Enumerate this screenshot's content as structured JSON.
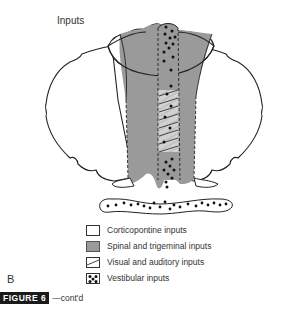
{
  "diagram": {
    "title": "Inputs",
    "panel_letter": "B",
    "colors": {
      "spinal_trigeminal_fill": "#9a9a9a",
      "outline": "#222222",
      "dot": "#111111"
    }
  },
  "legend": {
    "items": [
      {
        "label": "Corticopontine inputs",
        "pattern": "white"
      },
      {
        "label": "Spinal and trigeminal inputs",
        "pattern": "gray"
      },
      {
        "label": "Visual and auditory inputs",
        "pattern": "hatched"
      },
      {
        "label": "Vestibular inputs",
        "pattern": "dotted"
      }
    ]
  },
  "caption": {
    "badge": "FIGURE 6",
    "suffix": "—cont'd"
  }
}
